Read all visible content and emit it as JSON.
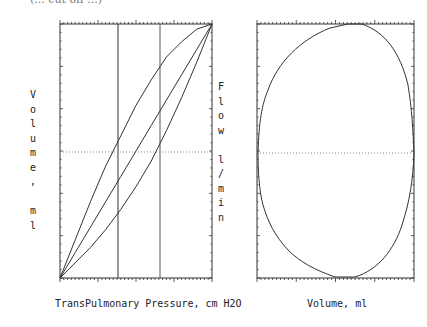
{
  "header": {
    "partial_caption": "(... cut off ...)"
  },
  "left_plot": {
    "ylabel_left": "Volume, ml",
    "ylabel_right": "Flow l/min",
    "xlabel": "TransPulmonary Pressure, cm H2O"
  },
  "right_plot": {
    "xlabel": "Volume, ml"
  },
  "colors": {
    "line": "#333333",
    "dotted": "#888888",
    "background": "#ffffff"
  },
  "chart_data": [
    {
      "type": "line",
      "title": "Pressure-Volume loop",
      "xlabel": "TransPulmonary Pressure, cm H2O",
      "ylabel": "Volume, ml",
      "ylabel_secondary": "Flow l/min",
      "grid": false,
      "tick_labels": "none shown",
      "series": [
        {
          "name": "inspiratory limb (upper)",
          "x": [
            0,
            0.1,
            0.2,
            0.3,
            0.4,
            0.5,
            0.6,
            0.7,
            0.8,
            0.9,
            1.0
          ],
          "y": [
            0,
            0.15,
            0.3,
            0.44,
            0.56,
            0.68,
            0.78,
            0.87,
            0.93,
            0.98,
            1.0
          ]
        },
        {
          "name": "compliance line (middle)",
          "x": [
            0,
            0.1,
            0.2,
            0.3,
            0.4,
            0.5,
            0.6,
            0.7,
            0.8,
            0.9,
            1.0
          ],
          "y": [
            0,
            0.1,
            0.2,
            0.3,
            0.4,
            0.5,
            0.6,
            0.7,
            0.8,
            0.9,
            1.0
          ]
        },
        {
          "name": "expiratory limb (lower)",
          "x": [
            0,
            0.1,
            0.2,
            0.3,
            0.4,
            0.5,
            0.6,
            0.7,
            0.8,
            0.9,
            1.0
          ],
          "y": [
            0,
            0.06,
            0.12,
            0.19,
            0.27,
            0.36,
            0.46,
            0.58,
            0.71,
            0.85,
            1.0
          ]
        }
      ],
      "annotations": [
        {
          "type": "vline",
          "x": 0.38
        },
        {
          "type": "vline",
          "x": 0.66
        },
        {
          "type": "hline",
          "y": 0.5,
          "style": "dotted"
        }
      ]
    },
    {
      "type": "line",
      "title": "Flow-Volume loop",
      "xlabel": "Volume, ml",
      "ylabel": "Flow l/min",
      "grid": false,
      "tick_labels": "none shown",
      "series": [
        {
          "name": "flow-volume loop",
          "shape": "closed oval",
          "x_range": [
            0,
            1
          ],
          "y_range": [
            -1,
            1
          ],
          "peak_inspiratory_at_x": 0.5,
          "peak_expiratory_at_x": 0.55
        }
      ],
      "annotations": [
        {
          "type": "hline",
          "y": 0,
          "style": "dotted"
        }
      ]
    }
  ]
}
